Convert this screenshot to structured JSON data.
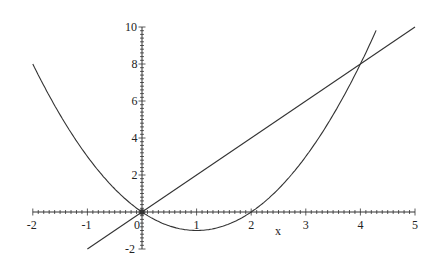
{
  "chart_data": {
    "type": "line",
    "title": "",
    "xlabel": "x",
    "ylabel": "",
    "xlim": [
      -2,
      5
    ],
    "ylim": [
      -2,
      10
    ],
    "grid": false,
    "legend": null,
    "x_ticks": [
      "-2",
      "-1",
      "0",
      "1",
      "2",
      "3",
      "4",
      "5"
    ],
    "y_ticks": [
      "-2",
      "2",
      "4",
      "6",
      "8",
      "10"
    ],
    "series": [
      {
        "name": "y = x^2 - 2x",
        "x": [
          -2,
          -1,
          0,
          1,
          2,
          3,
          4,
          4.3
        ],
        "values": [
          8,
          3,
          0,
          -1,
          0,
          3,
          8,
          9.89
        ]
      },
      {
        "name": "y = 2x",
        "x": [
          -1,
          0,
          1,
          2,
          3,
          4,
          5
        ],
        "values": [
          -2,
          0,
          2,
          4,
          6,
          8,
          10
        ]
      }
    ],
    "annotations": [
      "intersection at (0,0)",
      "intersection at (4,8)"
    ]
  },
  "colors": {
    "curve": "#333333",
    "axis": "#333333"
  }
}
